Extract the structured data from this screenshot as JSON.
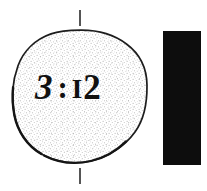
{
  "figure": {
    "background_color": "#ffffff",
    "width": 207,
    "height": 191,
    "disc": {
      "label": "stippled-disc",
      "fill_description": "light gray stipple dots",
      "outline_color": "#1a1a1a",
      "stipple_color": "#b9b9b9",
      "center_x": 80,
      "center_y": 96,
      "radius_x": 67,
      "radius_y": 66
    },
    "time_text": {
      "full": "3 : 12",
      "hour": "3",
      "separator": ":",
      "minute_first": "I",
      "minute_rest": "2",
      "minute": "12",
      "color": "#111111"
    },
    "black_bar": {
      "label": "solid-black-bar",
      "color": "#0d0d0d",
      "x": 163,
      "y": 31,
      "width": 38,
      "height": 134
    },
    "ticks": [
      {
        "name": "top-tick-mark",
        "x": 79,
        "y": 10,
        "height": 16,
        "color": "#555555"
      },
      {
        "name": "bottom-tick-mark",
        "x": 79,
        "y": 168,
        "height": 16,
        "color": "#555555"
      }
    ]
  }
}
